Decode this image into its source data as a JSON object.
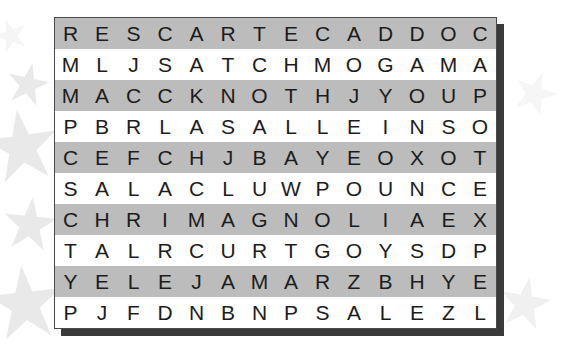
{
  "puzzle": {
    "title": "Word Search Grid",
    "columns": 14,
    "rows": 10,
    "colors": {
      "shaded_row": "#bcbcbc",
      "plain_row": "#ffffff",
      "letter": "#1c1c1c",
      "border": "#4a4a4a",
      "shadow": "#3a3a3a",
      "star": "#cfcfcf"
    },
    "grid": [
      {
        "shaded": true,
        "letters": [
          "R",
          "E",
          "S",
          "C",
          "A",
          "R",
          "T",
          "E",
          "C",
          "A",
          "D",
          "D",
          "O",
          "C"
        ]
      },
      {
        "shaded": false,
        "letters": [
          "M",
          "L",
          "J",
          "S",
          "A",
          "T",
          "C",
          "H",
          "M",
          "O",
          "G",
          "A",
          "M",
          "A"
        ]
      },
      {
        "shaded": true,
        "letters": [
          "M",
          "A",
          "C",
          "C",
          "K",
          "N",
          "O",
          "T",
          "H",
          "J",
          "Y",
          "O",
          "U",
          "P"
        ]
      },
      {
        "shaded": false,
        "letters": [
          "P",
          "B",
          "R",
          "L",
          "A",
          "S",
          "A",
          "L",
          "L",
          "E",
          "I",
          "N",
          "S",
          "O"
        ]
      },
      {
        "shaded": true,
        "letters": [
          "C",
          "E",
          "F",
          "C",
          "H",
          "J",
          "B",
          "A",
          "Y",
          "E",
          "O",
          "X",
          "O",
          "T"
        ]
      },
      {
        "shaded": false,
        "letters": [
          "S",
          "A",
          "L",
          "A",
          "C",
          "L",
          "U",
          "W",
          "P",
          "O",
          "U",
          "N",
          "C",
          "E"
        ]
      },
      {
        "shaded": true,
        "letters": [
          "C",
          "H",
          "R",
          "I",
          "M",
          "A",
          "G",
          "N",
          "O",
          "L",
          "I",
          "A",
          "E",
          "X"
        ]
      },
      {
        "shaded": false,
        "letters": [
          "T",
          "A",
          "L",
          "R",
          "C",
          "U",
          "R",
          "T",
          "G",
          "O",
          "Y",
          "S",
          "D",
          "P"
        ]
      },
      {
        "shaded": true,
        "letters": [
          "Y",
          "E",
          "L",
          "E",
          "J",
          "A",
          "M",
          "A",
          "R",
          "Z",
          "B",
          "H",
          "Y",
          "E"
        ]
      },
      {
        "shaded": false,
        "letters": [
          "P",
          "J",
          "F",
          "D",
          "N",
          "B",
          "N",
          "P",
          "S",
          "A",
          "L",
          "E",
          "Z",
          "L"
        ]
      }
    ],
    "row_strings": [
      "RESCARTECADDOC",
      "MLJSATCHMOGAMA",
      "MACCKNOTHJYOUP",
      "PBRLASALLEINSO",
      "CEFCHJBAYEOXOT",
      "SALACLUWPOUNCE",
      "CHRIMAGNOLIAEX",
      "TALRCURTGOYSDP",
      "YELEJAMARZBHYE",
      "PJFDNBNPSALEZL"
    ]
  },
  "decorations": {
    "stars": [
      {
        "name": "star-top-left-faint",
        "left": -6,
        "top": 18,
        "size": 34,
        "opacity": 0.2,
        "rotate": -18
      },
      {
        "name": "star-upper-left-small",
        "left": 6,
        "top": 62,
        "size": 44,
        "opacity": 0.45,
        "rotate": 12
      },
      {
        "name": "star-mid-left-large",
        "left": -16,
        "top": 108,
        "size": 76,
        "opacity": 0.45,
        "rotate": -8
      },
      {
        "name": "star-lower-left-medium",
        "left": 2,
        "top": 196,
        "size": 56,
        "opacity": 0.45,
        "rotate": 6
      },
      {
        "name": "star-bottom-left-large",
        "left": -14,
        "top": 264,
        "size": 78,
        "opacity": 0.45,
        "rotate": -6
      },
      {
        "name": "star-right-edge-faint",
        "left": 512,
        "top": 70,
        "size": 46,
        "opacity": 0.18,
        "rotate": 20
      },
      {
        "name": "star-bottom-right",
        "left": 498,
        "top": 276,
        "size": 54,
        "opacity": 0.3,
        "rotate": 10
      }
    ]
  }
}
